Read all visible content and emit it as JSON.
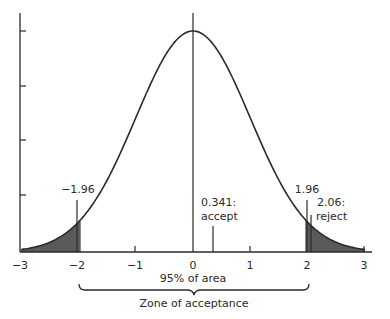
{
  "chart_data": {
    "type": "area",
    "title": "",
    "xlabel": "",
    "ylabel": "",
    "distribution": "standard normal",
    "xlim": [
      -3,
      3
    ],
    "x_ticks": [
      -3,
      -2,
      -1,
      0,
      1,
      2,
      3
    ],
    "x_tick_labels": [
      "−3",
      "−2",
      "−1",
      "0",
      "1",
      "2",
      "3"
    ],
    "y_ticks_count": 4,
    "y_tick_labels": [],
    "grid": false,
    "legend": null,
    "shaded_regions": [
      {
        "name": "left-rejection-tail",
        "from": -3,
        "to": -1.96,
        "fill": "#5a5a5a"
      },
      {
        "name": "right-rejection-tail",
        "from": 1.96,
        "to": 3,
        "fill": "#5a5a5a"
      }
    ],
    "vertical_markers": [
      {
        "x": -1.96,
        "label": "−1.96"
      },
      {
        "x": 0.341,
        "label_line1": "0.341:",
        "label_line2": "accept"
      },
      {
        "x": 1.96,
        "label": "1.96"
      },
      {
        "x": 2.06,
        "label_line1": "2.06:",
        "label_line2": "reject"
      }
    ],
    "annotations": [
      {
        "text": "95% of area",
        "position": "below x-axis, centered at 0"
      },
      {
        "text": "Zone of acceptance",
        "position": "below brace spanning −1.96 to 1.96"
      }
    ]
  },
  "labels": {
    "x_ticks": [
      "−3",
      "−2",
      "−1",
      "0",
      "1",
      "2",
      "3"
    ],
    "marker_left": "−1.96",
    "marker_right": "1.96",
    "accept_value": "0.341:",
    "accept_word": "accept",
    "reject_value": "2.06:",
    "reject_word": "reject",
    "area_label": "95% of area",
    "zone_label": "Zone of acceptance"
  },
  "colors": {
    "ink": "#2a2a2a",
    "shade": "#5a5a5a",
    "background": "#ffffff"
  }
}
